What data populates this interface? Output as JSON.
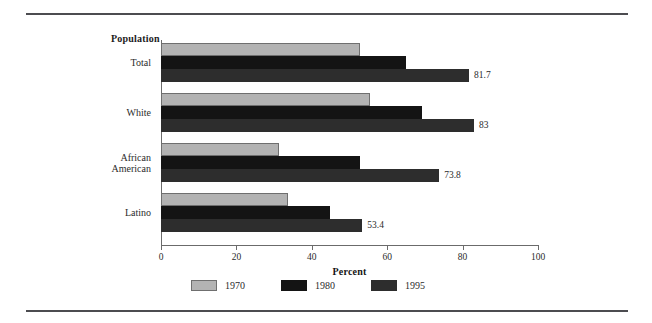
{
  "figure": {
    "legend_title": "Population",
    "xaxis_title": "Percent",
    "rules": {
      "color": "#4c4c50"
    }
  },
  "chart_data": {
    "type": "bar",
    "orientation": "horizontal",
    "title": "",
    "legend_title": "Population",
    "xlabel": "Percent",
    "ylabel": "",
    "xlim": [
      0,
      100
    ],
    "xticks": [
      0,
      20,
      40,
      60,
      80,
      100
    ],
    "xtick_labels": [
      "0",
      "20",
      "40",
      "60",
      "80",
      "100"
    ],
    "grid": false,
    "legend_position": "bottom",
    "categories": [
      "Total",
      "White",
      "African American",
      "Latino"
    ],
    "category_lines": [
      [
        "Total"
      ],
      [
        "White"
      ],
      [
        "African",
        "American"
      ],
      [
        "Latino"
      ]
    ],
    "series": [
      {
        "name": "1970",
        "color": "#b3b3b3",
        "values": [
          52.8,
          55.4,
          31.3,
          33.7
        ],
        "labels": [
          "",
          "",
          "",
          ""
        ]
      },
      {
        "name": "1980",
        "color": "#141414",
        "values": [
          65.0,
          69.2,
          52.8,
          44.8
        ],
        "labels": [
          "",
          "",
          "",
          ""
        ]
      },
      {
        "name": "1995",
        "color": "#2d2d2d",
        "values": [
          81.7,
          83.0,
          73.8,
          53.4
        ],
        "labels": [
          "81.7",
          "83",
          "73.8",
          "53.4"
        ]
      }
    ]
  }
}
